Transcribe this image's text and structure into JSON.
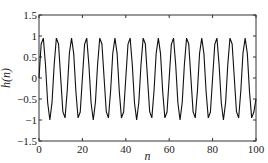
{
  "chart_data": {
    "type": "line",
    "title": "",
    "xlabel": "n",
    "ylabel": "h(n)",
    "xlim": [
      0,
      100
    ],
    "ylim": [
      -1.5,
      1.5
    ],
    "xticks": [
      0,
      20,
      40,
      60,
      80,
      100
    ],
    "xtick_labels": [
      "0",
      "20",
      "40",
      "60",
      "80",
      "100"
    ],
    "yticks": [
      -1.5,
      -1,
      -0.5,
      0,
      0.5,
      1,
      1.5
    ],
    "ytick_labels": [
      "-1.5",
      "-1",
      "-0.5",
      "0",
      "0.5",
      "1",
      "1.5"
    ],
    "grid": false,
    "legend": "none",
    "series": [
      {
        "name": "h(n)",
        "color": "#111111",
        "description": "sampled sinusoid, amplitude ~1, period ~6.7 samples",
        "x": [
          0,
          1,
          2,
          3,
          4,
          5,
          6,
          7,
          8,
          9,
          10,
          11,
          12,
          13,
          14,
          15,
          16,
          17,
          18,
          19,
          20,
          21,
          22,
          23,
          24,
          25,
          26,
          27,
          28,
          29,
          30,
          31,
          32,
          33,
          34,
          35,
          36,
          37,
          38,
          39,
          40,
          41,
          42,
          43,
          44,
          45,
          46,
          47,
          48,
          49,
          50,
          51,
          52,
          53,
          54,
          55,
          56,
          57,
          58,
          59,
          60,
          61,
          62,
          63,
          64,
          65,
          66,
          67,
          68,
          69,
          70,
          71,
          72,
          73,
          74,
          75,
          76,
          77,
          78,
          79,
          80,
          81,
          82,
          83,
          84,
          85,
          86,
          87,
          88,
          89,
          90,
          91,
          92,
          93,
          94,
          95,
          96,
          97,
          98,
          99,
          100
        ],
        "values": [
          0.0,
          0.81,
          0.95,
          0.31,
          -0.59,
          -1.0,
          -0.58,
          0.32,
          0.95,
          0.81,
          0.0,
          -0.8,
          -0.95,
          -0.31,
          0.59,
          0.95,
          0.58,
          -0.32,
          -0.95,
          -0.81,
          0.0,
          0.8,
          0.95,
          0.31,
          -0.59,
          -1.0,
          -0.58,
          0.32,
          0.95,
          0.81,
          0.0,
          -0.8,
          -0.95,
          -0.31,
          0.59,
          0.95,
          0.58,
          -0.32,
          -0.95,
          -0.81,
          0.0,
          0.8,
          0.95,
          0.31,
          -0.59,
          -1.0,
          -0.58,
          0.32,
          0.95,
          0.81,
          0.0,
          -0.8,
          -0.95,
          -0.31,
          0.59,
          0.95,
          0.58,
          -0.32,
          -0.95,
          -0.81,
          0.0,
          0.8,
          0.95,
          0.31,
          -0.59,
          -1.0,
          -0.58,
          0.32,
          0.95,
          0.81,
          0.0,
          -0.8,
          -0.95,
          -0.31,
          0.59,
          0.95,
          0.58,
          -0.32,
          -0.95,
          -0.81,
          0.0,
          0.8,
          0.95,
          0.31,
          -0.59,
          -1.0,
          -0.58,
          0.32,
          0.95,
          0.81,
          0.0,
          -0.8,
          -0.95,
          -0.31,
          0.59,
          0.95,
          0.58,
          -0.32,
          -0.95,
          -0.81,
          -0.5
        ]
      }
    ]
  }
}
